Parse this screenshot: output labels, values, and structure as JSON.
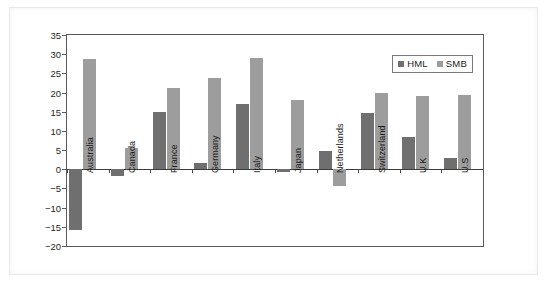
{
  "figure": {
    "kind": "bar-chart-figure"
  },
  "chart_data": {
    "type": "bar",
    "title": "",
    "xlabel": "",
    "ylabel": "Past Year Return (%)",
    "ylim": [
      -20,
      35
    ],
    "ytick_step": 5,
    "yticks": [
      35,
      30,
      25,
      20,
      15,
      10,
      5,
      0,
      -5,
      -10,
      -15,
      -20
    ],
    "ytick_labels": [
      "35",
      "30",
      "25",
      "20",
      "15",
      "10",
      "5",
      "0",
      "-5",
      "-10",
      "-15",
      "-20"
    ],
    "grid": false,
    "legend_position": "top-right",
    "categories": [
      "Australia",
      "Canada",
      "France",
      "Germany",
      "Italy",
      "Japan",
      "Netherlands",
      "Switzerland",
      "U.K",
      "U.S"
    ],
    "series": [
      {
        "name": "HML",
        "color": "#706f6f",
        "values": [
          -15.8,
          -1.8,
          15.0,
          1.6,
          16.9,
          -0.8,
          4.7,
          14.6,
          8.4,
          2.9
        ]
      },
      {
        "name": "SMB",
        "color": "#9d9d9d",
        "values": [
          28.7,
          5.6,
          21.1,
          23.7,
          29.0,
          18.0,
          -4.3,
          19.8,
          19.2,
          19.4
        ]
      }
    ]
  },
  "legend": {
    "items": [
      {
        "label": "HML",
        "color": "#706f6f"
      },
      {
        "label": "SMB",
        "color": "#9d9d9d"
      }
    ]
  },
  "colors": {
    "hml": "#706f6f",
    "smb": "#9d9d9d",
    "axis": "#5a5a5a",
    "text": "#1a1a1a",
    "background": "#ffffff"
  }
}
